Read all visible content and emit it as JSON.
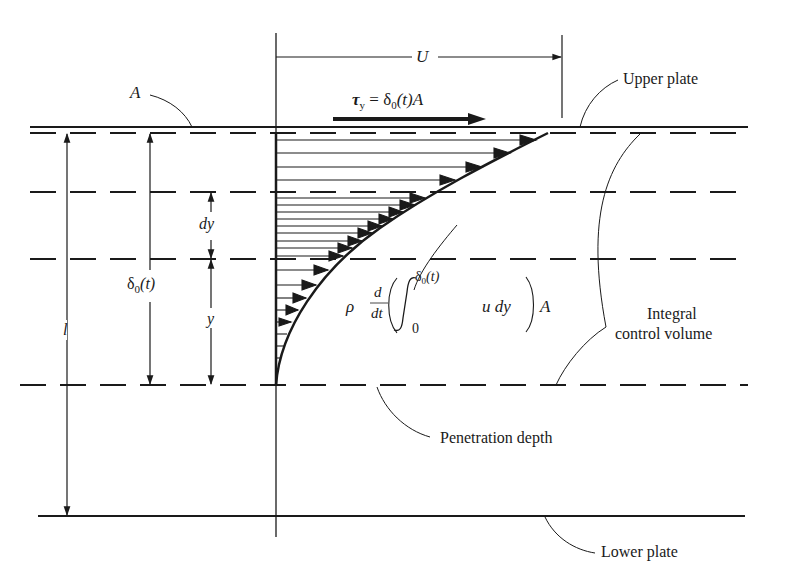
{
  "figure": {
    "labels": {
      "area": "A",
      "velocity": "U",
      "shear_tau": "τ",
      "shear_tau_sub": "y",
      "shear_eq": " = δ",
      "shear_eq_sub": "0",
      "shear_eq_rest": "(t)A",
      "upper_plate": "Upper plate",
      "lower_plate": "Lower plate",
      "penetration_depth": "Penetration depth",
      "integral_cv_line1": "Integral",
      "integral_cv_line2": "control volume",
      "dy": "dy",
      "y": "y",
      "delta": "δ",
      "delta_sub": "0",
      "delta_rest": "(t)",
      "gap": "l",
      "rho": "ρ",
      "d_num": "d",
      "d_den": "dt",
      "integral_upper": "δ",
      "integral_upper_sub": "0",
      "integral_upper_rest": "(t)",
      "integral_lower": "0",
      "integrand": "u dy",
      "integral_A": "A"
    },
    "colors": {
      "ink": "#1a1a1a",
      "background": "#ffffff"
    }
  }
}
